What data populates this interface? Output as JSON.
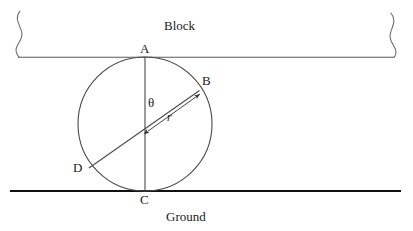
{
  "figure": {
    "background_color": "#ffffff",
    "line_color": "#3a3a3a",
    "ground_color": "#111111",
    "text_color": "#1a1a1a"
  },
  "captions": {
    "block": "Block",
    "ground": "Ground"
  },
  "points": {
    "a": "A",
    "b": "B",
    "c": "C",
    "d": "D"
  },
  "annotations": {
    "angle": "θ",
    "radius": "r"
  },
  "geometry": {
    "circle": {
      "cx": 145,
      "cy": 124,
      "r": 67
    },
    "block_line": {
      "x1": 18,
      "y1": 57,
      "x2": 394,
      "y2": 57
    },
    "ground_line": {
      "x1": 10,
      "y1": 191,
      "x2": 401,
      "y2": 191
    },
    "vertical_chord": {
      "x1": 145,
      "y1": 57,
      "x2": 145,
      "y2": 191
    },
    "diameter_db": {
      "x1": 89,
      "y1": 168,
      "x2": 199,
      "y2": 90
    },
    "radius_arrow": {
      "x1": 147,
      "y1": 131,
      "x2": 200,
      "y2": 93
    }
  }
}
